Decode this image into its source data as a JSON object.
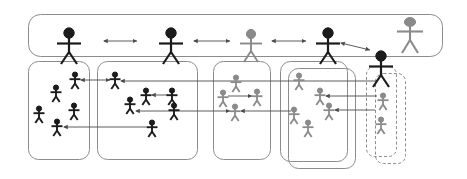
{
  "diagram": {
    "type": "organizational-network",
    "canvas": {
      "width": 467,
      "height": 179,
      "background": "#ffffff"
    },
    "colors": {
      "dark_actor": "#1b1b1b",
      "gray_actor": "#8a8a8a",
      "box_stroke": "#8c8c8c",
      "arrow_dark": "#4a4a4a",
      "arrow_gray": "#8f8f8f"
    },
    "coordination_bar": {
      "label": "coordination-layer",
      "shape": "rounded-rectangle",
      "style": "solid",
      "x": 28,
      "y": 14,
      "width": 415,
      "height": 42,
      "radius": 12,
      "leaders": [
        {
          "id": "leader-1",
          "color": "#1b1b1b",
          "size": "large",
          "x": 69,
          "y": 46,
          "group": "group-1"
        },
        {
          "id": "leader-2",
          "color": "#1b1b1b",
          "size": "large",
          "x": 171,
          "y": 46,
          "group": "group-2"
        },
        {
          "id": "leader-3",
          "color": "#8a8a8a",
          "size": "large",
          "x": 251,
          "y": 46,
          "group": "group-3"
        },
        {
          "id": "leader-4",
          "color": "#1b1b1b",
          "size": "large",
          "x": 328,
          "y": 46,
          "group": "group-4"
        },
        {
          "id": "leader-5",
          "color": "#1b1b1b",
          "size": "large",
          "x": 381,
          "y": 58,
          "group": "group-5"
        },
        {
          "id": "leader-6",
          "color": "#8a8a8a",
          "size": "large",
          "x": 410,
          "y": 32,
          "group": "none"
        }
      ],
      "links": [
        {
          "from": "leader-1",
          "to": "leader-2",
          "direction": "bidirectional",
          "x1": 102,
          "x2": 139,
          "y": 41
        },
        {
          "from": "leader-2",
          "to": "leader-3",
          "direction": "bidirectional",
          "x1": 192,
          "x2": 232,
          "y": 41
        },
        {
          "from": "leader-3",
          "to": "leader-4",
          "direction": "bidirectional",
          "x1": 270,
          "x2": 308,
          "y": 41
        },
        {
          "from": "leader-4",
          "to": "leader-5",
          "direction": "bidirectional",
          "style": "diagonal"
        }
      ]
    },
    "groups": [
      {
        "id": "group-1",
        "label": "team-1",
        "style": "solid",
        "stacked": false,
        "x": 28,
        "y": 61,
        "width": 62,
        "height": 99,
        "radius": 10,
        "members": [
          {
            "id": "g1-m1",
            "color": "#1b1b1b",
            "x": 75,
            "y": 79
          },
          {
            "id": "g1-m2",
            "color": "#1b1b1b",
            "x": 56,
            "y": 92
          },
          {
            "id": "g1-m3",
            "color": "#1b1b1b",
            "x": 39,
            "y": 113
          },
          {
            "id": "g1-m4",
            "color": "#1b1b1b",
            "x": 74,
            "y": 110
          },
          {
            "id": "g1-m5",
            "color": "#1b1b1b",
            "x": 57,
            "y": 126
          }
        ]
      },
      {
        "id": "group-2",
        "label": "team-2",
        "style": "solid",
        "stacked": false,
        "x": 97,
        "y": 61,
        "width": 101,
        "height": 99,
        "radius": 10,
        "members": [
          {
            "id": "g2-m1",
            "color": "#1b1b1b",
            "x": 115,
            "y": 79
          },
          {
            "id": "g2-m2",
            "color": "#1b1b1b",
            "x": 146,
            "y": 95
          },
          {
            "id": "g2-m3",
            "color": "#1b1b1b",
            "x": 130,
            "y": 104
          },
          {
            "id": "g2-m4",
            "color": "#1b1b1b",
            "x": 172,
            "y": 95
          },
          {
            "id": "g2-m5",
            "color": "#1b1b1b",
            "x": 174,
            "y": 110
          },
          {
            "id": "g2-m6",
            "color": "#1b1b1b",
            "x": 152,
            "y": 127
          }
        ]
      },
      {
        "id": "group-3",
        "label": "team-3",
        "style": "solid",
        "stacked": false,
        "x": 213,
        "y": 61,
        "width": 58,
        "height": 99,
        "radius": 10,
        "members": [
          {
            "id": "g3-m1",
            "color": "#8a8a8a",
            "x": 236,
            "y": 82
          },
          {
            "id": "g3-m2",
            "color": "#8a8a8a",
            "x": 223,
            "y": 97
          },
          {
            "id": "g3-m3",
            "color": "#8a8a8a",
            "x": 257,
            "y": 96
          },
          {
            "id": "g3-m4",
            "color": "#8a8a8a",
            "x": 235,
            "y": 111
          }
        ]
      },
      {
        "id": "group-4",
        "label": "team-4",
        "style": "solid",
        "stacked": true,
        "x": 280,
        "y": 61,
        "width": 68,
        "height": 101,
        "radius": 10,
        "stack_offset": {
          "x": 8,
          "y": 7
        },
        "members": [
          {
            "id": "g4-m1",
            "color": "#8a8a8a",
            "x": 299,
            "y": 80
          },
          {
            "id": "g4-m2",
            "color": "#8a8a8a",
            "x": 320,
            "y": 95
          },
          {
            "id": "g4-m3",
            "color": "#8a8a8a",
            "x": 329,
            "y": 110
          },
          {
            "id": "g4-m4",
            "color": "#8a8a8a",
            "x": 294,
            "y": 114
          },
          {
            "id": "g4-m5",
            "color": "#8a8a8a",
            "x": 308,
            "y": 127
          }
        ]
      },
      {
        "id": "group-5",
        "label": "team-5",
        "style": "dashed",
        "stacked": true,
        "x": 366,
        "y": 66,
        "width": 31,
        "height": 91,
        "radius": 8,
        "stack_offset": {
          "x": 9,
          "y": 7
        },
        "members": [
          {
            "id": "g5-m1",
            "color": "#8a8a8a",
            "x": 383,
            "y": 100
          },
          {
            "id": "g5-m2",
            "color": "#8a8a8a",
            "x": 381,
            "y": 124
          }
        ]
      }
    ],
    "cross_links": [
      {
        "id": "link-a",
        "from": "g1-m1",
        "to": "g2-m1",
        "direction": "bidirectional",
        "y": 80,
        "x1": 80,
        "x2": 111
      },
      {
        "id": "link-b",
        "from": "g2-m1",
        "to": "g5-m1",
        "direction": "left",
        "y": 81,
        "x1": 120,
        "x2": 378
      },
      {
        "id": "link-c",
        "from": "g2-m4",
        "to": "g2-m2",
        "direction": "left",
        "y": 95,
        "x1": 151,
        "x2": 167
      },
      {
        "id": "link-d",
        "from": "g3-m2",
        "to": "g3-m3",
        "direction": "right",
        "y": 96,
        "x1": 228,
        "x2": 253
      },
      {
        "id": "link-e",
        "from": "g4-m2",
        "to": "g5-m1",
        "direction": "left",
        "y": 96,
        "x1": 325,
        "x2": 378
      },
      {
        "id": "link-f",
        "from": "g2-m6",
        "to": "g1-m5",
        "direction": "left",
        "y": 127,
        "x1": 63,
        "x2": 147
      },
      {
        "id": "link-g",
        "from": "g2-m3",
        "to": "g3-m4",
        "direction": "bidirectional",
        "y": 111,
        "x1": 135,
        "x2": 231
      },
      {
        "id": "link-h",
        "from": "g3-m4",
        "to": "g4-m4",
        "direction": "left",
        "y": 111,
        "x1": 240,
        "x2": 290
      },
      {
        "id": "link-i",
        "from": "g5-m1",
        "to": "g4-m3",
        "direction": "left",
        "y": 110,
        "x1": 334,
        "x2": 376
      }
    ]
  }
}
